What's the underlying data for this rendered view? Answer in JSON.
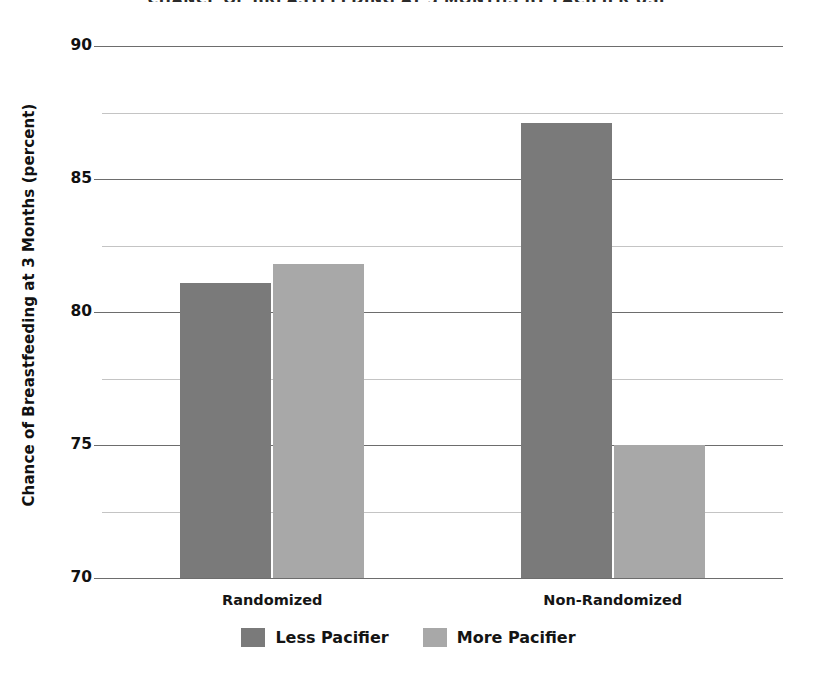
{
  "chart_data": {
    "type": "bar",
    "title": "CHANCE OF BREASTFEEDING AT 3 MONTHS BY PACIFIER USE",
    "subtitle": "",
    "xlabel": "",
    "ylabel": "Chance of Breastfeeding at 3 Months (percent)",
    "categories": [
      "Randomized",
      "Non-Randomized"
    ],
    "series": [
      {
        "name": "Less Pacifier",
        "values": [
          81.1,
          87.1
        ],
        "color": "#7a7a7a"
      },
      {
        "name": "More Pacifier",
        "values": [
          81.8,
          75.0
        ],
        "color": "#a8a8a8"
      }
    ],
    "ylim": [
      70,
      90
    ],
    "y_major_ticks": [
      90,
      85,
      80,
      75,
      70
    ],
    "y_minor_ticks": [
      87.5,
      82.5,
      77.5,
      72.5
    ],
    "y_tick_labels": [
      "90",
      "85",
      "80",
      "75",
      "70"
    ],
    "grid": true,
    "grid_axis": "y",
    "legend_position": "bottom",
    "background_color": "#ffffff",
    "grid_major_color": "#6d6d6d",
    "grid_minor_color": "#c4c4c4"
  },
  "axis": {
    "y_title": "Chance of Breastfeeding at 3 Months (percent)"
  },
  "legend": {
    "items": [
      {
        "label": "Less Pacifier",
        "color": "#7a7a7a"
      },
      {
        "label": "More Pacifier",
        "color": "#a8a8a8"
      }
    ]
  }
}
